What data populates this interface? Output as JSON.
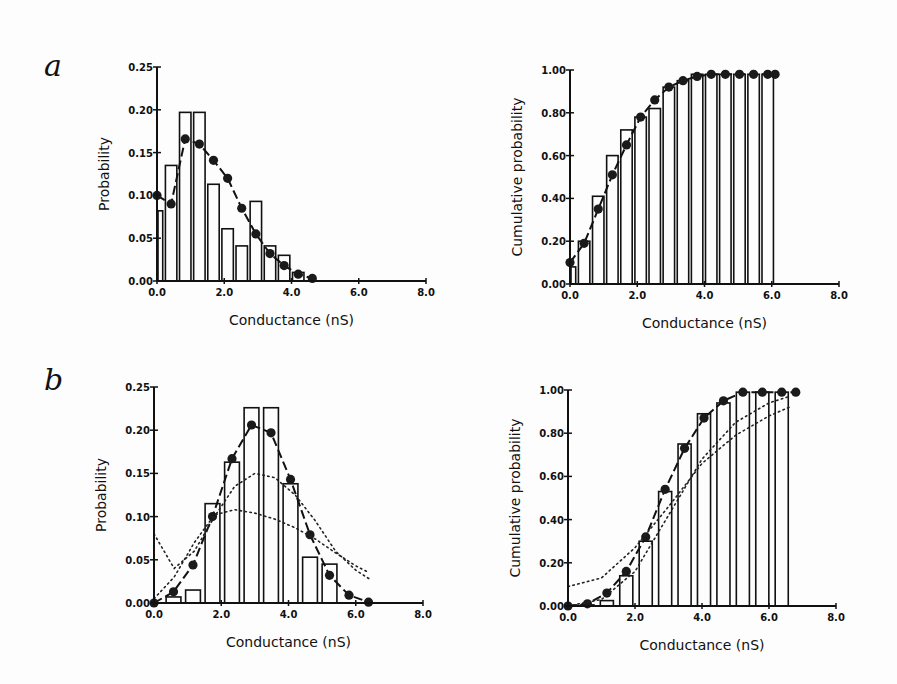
{
  "figure": {
    "panel_labels": [
      "a",
      "b"
    ]
  },
  "chart_data": [
    {
      "id": "a-left",
      "panel": "a",
      "type": "bar",
      "xlabel": "Conductance (nS)",
      "ylabel": "Probability",
      "xlim": [
        0,
        8.0
      ],
      "ylim": [
        0,
        0.25
      ],
      "xticks": [
        "0.0",
        "2.0",
        "4.0",
        "6.0",
        "8.0"
      ],
      "yticks": [
        "0.00",
        "0.05",
        "0.10",
        "0.15",
        "0.20",
        "0.25"
      ],
      "grid": false,
      "bar_width": 0.4,
      "bars": {
        "name": "Observed histogram",
        "x": [
          0.0,
          0.42,
          0.84,
          1.26,
          1.68,
          2.1,
          2.52,
          2.94,
          3.36,
          3.78,
          4.2
        ],
        "values": [
          0.082,
          0.135,
          0.197,
          0.197,
          0.113,
          0.061,
          0.041,
          0.093,
          0.041,
          0.03,
          0.01
        ]
      },
      "series": [
        {
          "name": "Model fit",
          "style": "dashed-line-filled-circles",
          "x": [
            0.0,
            0.42,
            0.84,
            1.26,
            1.68,
            2.1,
            2.52,
            2.94,
            3.36,
            3.78,
            4.2,
            4.62
          ],
          "values": [
            0.1,
            0.09,
            0.166,
            0.16,
            0.141,
            0.12,
            0.085,
            0.055,
            0.032,
            0.018,
            0.008,
            0.003
          ]
        }
      ]
    },
    {
      "id": "a-right",
      "panel": "a",
      "type": "bar",
      "xlabel": "Conductance (nS)",
      "ylabel": "Cumulative probability",
      "xlim": [
        0,
        8.0
      ],
      "ylim": [
        0,
        1.0
      ],
      "xticks": [
        "0.0",
        "2.0",
        "4.0",
        "6.0",
        "8.0"
      ],
      "yticks": [
        "0.00",
        "0.20",
        "0.40",
        "0.60",
        "0.80",
        "1.00"
      ],
      "grid": false,
      "bar_width": 0.4,
      "bars": {
        "name": "Observed cumulative histogram",
        "x": [
          0.0,
          0.42,
          0.84,
          1.26,
          1.68,
          2.1,
          2.52,
          2.94,
          3.36,
          3.78,
          4.2,
          4.62,
          5.04,
          5.46,
          5.88
        ],
        "values": [
          0.08,
          0.2,
          0.41,
          0.6,
          0.72,
          0.78,
          0.82,
          0.92,
          0.95,
          0.98,
          0.98,
          0.98,
          0.98,
          0.98,
          0.98
        ]
      },
      "series": [
        {
          "name": "Model fit (cumulative)",
          "style": "dashed-line-filled-circles",
          "x": [
            0.0,
            0.42,
            0.84,
            1.26,
            1.68,
            2.1,
            2.52,
            2.94,
            3.36,
            3.78,
            4.2,
            4.62,
            5.04,
            5.46,
            5.88,
            6.1
          ],
          "values": [
            0.1,
            0.19,
            0.35,
            0.51,
            0.65,
            0.78,
            0.86,
            0.92,
            0.95,
            0.97,
            0.98,
            0.98,
            0.98,
            0.98,
            0.98,
            0.98
          ]
        }
      ]
    },
    {
      "id": "b-left",
      "panel": "b",
      "type": "bar",
      "xlabel": "Conductance (nS)",
      "ylabel": "Probability",
      "xlim": [
        0,
        8.0
      ],
      "ylim": [
        0,
        0.25
      ],
      "xticks": [
        "0.0",
        "2.0",
        "4.0",
        "6.0",
        "8.0"
      ],
      "yticks": [
        "0.00",
        "0.05",
        "0.10",
        "0.15",
        "0.20",
        "0.25"
      ],
      "grid": false,
      "bar_width": 0.5,
      "bars": {
        "name": "Observed histogram",
        "x": [
          0.58,
          1.16,
          1.74,
          2.32,
          2.9,
          3.48,
          4.06,
          4.64,
          5.22
        ],
        "values": [
          0.007,
          0.015,
          0.115,
          0.163,
          0.226,
          0.226,
          0.138,
          0.053,
          0.045
        ]
      },
      "series": [
        {
          "name": "Model fit",
          "style": "dashed-line-filled-circles",
          "x": [
            0.0,
            0.58,
            1.16,
            1.74,
            2.32,
            2.9,
            3.48,
            4.06,
            4.64,
            5.22,
            5.8,
            6.38
          ],
          "values": [
            0.0,
            0.013,
            0.044,
            0.1,
            0.167,
            0.206,
            0.197,
            0.143,
            0.079,
            0.032,
            0.009,
            0.001
          ]
        },
        {
          "name": "Alternative model 1",
          "style": "dotted",
          "x": [
            0.0,
            0.6,
            1.2,
            1.8,
            2.4,
            3.0,
            3.6,
            4.2,
            4.8,
            5.4,
            6.0,
            6.4
          ],
          "values": [
            0.08,
            0.04,
            0.06,
            0.1,
            0.135,
            0.15,
            0.145,
            0.125,
            0.095,
            0.06,
            0.038,
            0.028
          ]
        },
        {
          "name": "Alternative model 2",
          "style": "dotted",
          "x": [
            0.0,
            0.6,
            1.2,
            1.8,
            2.4,
            3.0,
            3.6,
            4.2,
            4.8,
            5.4,
            6.0,
            6.4
          ],
          "values": [
            0.005,
            0.03,
            0.07,
            0.102,
            0.108,
            0.104,
            0.097,
            0.087,
            0.074,
            0.058,
            0.043,
            0.035
          ]
        }
      ]
    },
    {
      "id": "b-right",
      "panel": "b",
      "type": "bar",
      "xlabel": "Conductance (nS)",
      "ylabel": "Cumulative probability",
      "xlim": [
        0,
        8.0
      ],
      "ylim": [
        0,
        1.0
      ],
      "xticks": [
        "0.0",
        "2.0",
        "4.0",
        "6.0",
        "8.0"
      ],
      "yticks": [
        "0.00",
        "0.20",
        "0.40",
        "0.60",
        "0.80",
        "1.00"
      ],
      "grid": false,
      "bar_width": 0.45,
      "bars": {
        "name": "Observed cumulative histogram",
        "x": [
          0.58,
          1.16,
          1.74,
          2.32,
          2.9,
          3.48,
          4.06,
          4.64,
          5.22,
          5.8,
          6.38
        ],
        "values": [
          0.005,
          0.025,
          0.14,
          0.3,
          0.53,
          0.75,
          0.89,
          0.94,
          0.99,
          0.99,
          0.99
        ]
      },
      "series": [
        {
          "name": "Model fit (cumulative)",
          "style": "dashed-line-filled-circles",
          "x": [
            0.0,
            0.58,
            1.16,
            1.74,
            2.32,
            2.9,
            3.48,
            4.06,
            4.64,
            5.22,
            5.8,
            6.38,
            6.8
          ],
          "values": [
            0.0,
            0.01,
            0.06,
            0.16,
            0.32,
            0.54,
            0.73,
            0.87,
            0.95,
            0.99,
            0.99,
            0.99,
            0.99
          ]
        },
        {
          "name": "Alternative model 1 (cumulative)",
          "style": "dotted",
          "x": [
            0.0,
            1.0,
            2.0,
            3.0,
            4.0,
            5.0,
            6.0,
            6.6
          ],
          "values": [
            0.09,
            0.13,
            0.27,
            0.46,
            0.66,
            0.79,
            0.88,
            0.92
          ]
        },
        {
          "name": "Alternative model 2 (cumulative)",
          "style": "dotted",
          "x": [
            0.0,
            1.0,
            2.0,
            3.0,
            4.0,
            5.0,
            6.0,
            6.6
          ],
          "values": [
            0.0,
            0.03,
            0.16,
            0.42,
            0.68,
            0.85,
            0.94,
            0.97
          ]
        }
      ]
    }
  ],
  "layout": {
    "plots": [
      {
        "x0": 157,
        "x1": 426,
        "y0": 281,
        "y1": 67
      },
      {
        "x0": 570,
        "x1": 839,
        "y0": 284,
        "y1": 70
      },
      {
        "x0": 154,
        "x1": 423,
        "y0": 603,
        "y1": 387
      },
      {
        "x0": 568,
        "x1": 836,
        "y0": 606,
        "y1": 390
      }
    ]
  }
}
